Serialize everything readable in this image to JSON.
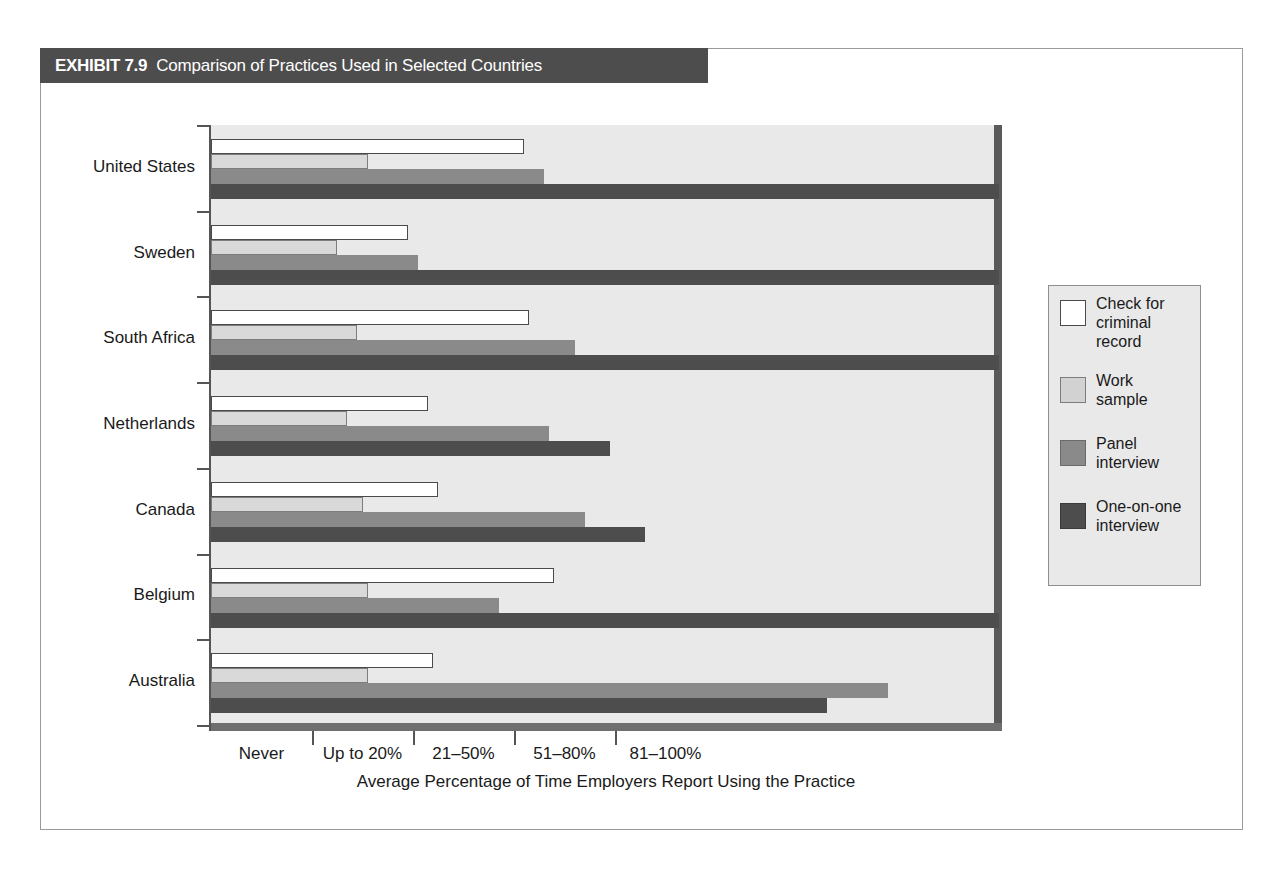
{
  "exhibit": {
    "number": "EXHIBIT 7.9",
    "title": "Comparison of Practices Used in Selected Countries"
  },
  "chart_data": {
    "type": "bar",
    "orientation": "horizontal",
    "title": "Comparison of Practices Used in Selected Countries",
    "xlabel": "Average Percentage of Time Employers Report Using the Practice",
    "ylabel": "",
    "grid": false,
    "legend_position": "right",
    "xtick_labels": [
      "Never",
      "Up to 20%",
      "21–50%",
      "51–80%",
      "81–100%"
    ],
    "xtick_values": [
      0,
      1,
      2,
      3,
      4
    ],
    "xlim": [
      0,
      4
    ],
    "categories": [
      "United States",
      "Sweden",
      "South Africa",
      "Netherlands",
      "Canada",
      "Belgium",
      "Australia"
    ],
    "series": [
      {
        "name": "Check for criminal record",
        "color": "#ffffff",
        "values": [
          3.1,
          1.95,
          3.15,
          2.15,
          2.25,
          3.4,
          2.2
        ]
      },
      {
        "name": "Work sample",
        "color": "#d9d9d9",
        "values": [
          1.55,
          1.25,
          1.45,
          1.35,
          1.5,
          1.55,
          1.55
        ]
      },
      {
        "name": "Panel interview",
        "color": "#8a8a8a",
        "values": [
          3.3,
          2.05,
          3.6,
          3.35,
          3.7,
          2.85,
          6.7
        ]
      },
      {
        "name": "One-on-one interview",
        "color": "#4d4d4d",
        "values": [
          7.8,
          7.8,
          7.8,
          3.95,
          4.3,
          7.8,
          6.1
        ]
      }
    ]
  },
  "legend": {
    "items": [
      {
        "label": "Check for\ncriminal\nrecord",
        "swatch": "white"
      },
      {
        "label": "Work\nsample",
        "swatch": "light-gray"
      },
      {
        "label": "Panel\ninterview",
        "swatch": "medium-gray"
      },
      {
        "label": "One-on-one\ninterview",
        "swatch": "dark-gray"
      }
    ]
  },
  "colors": {
    "header_band": "#4d4d4d",
    "plot_background": "#e9e9e9",
    "frame_border": "#9a9a9a",
    "series_white": "#ffffff",
    "series_light": "#d9d9d9",
    "series_medium": "#8a8a8a",
    "series_dark": "#4d4d4d"
  }
}
